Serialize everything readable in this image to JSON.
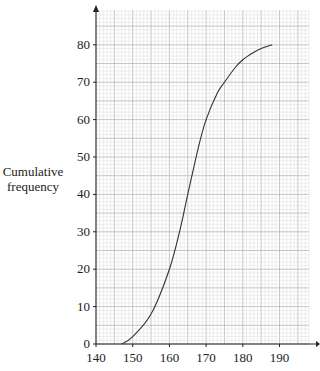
{
  "chart_data": {
    "type": "line",
    "title": "",
    "xlabel": "",
    "ylabel": "Cumulative frequency",
    "xlim": [
      140,
      198
    ],
    "ylim": [
      0,
      90
    ],
    "xticks": [
      140,
      150,
      160,
      170,
      180,
      190
    ],
    "yticks": [
      0,
      10,
      20,
      30,
      40,
      50,
      60,
      70,
      80
    ],
    "grid": true,
    "legend": null,
    "series": [
      {
        "name": "cumulative frequency curve",
        "x": [
          147,
          150,
          155,
          160,
          163,
          165,
          168,
          170,
          173,
          175,
          178,
          180,
          183,
          185,
          188
        ],
        "y": [
          0,
          2,
          8,
          20,
          31,
          40,
          53,
          60,
          67,
          70,
          74,
          76,
          78,
          79,
          80
        ]
      }
    ]
  },
  "labels": {
    "ylabel_line1": "Cumulative",
    "ylabel_line2": "frequency"
  }
}
